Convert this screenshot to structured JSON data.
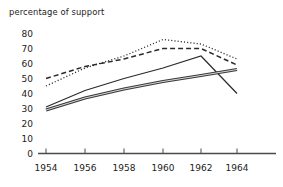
{
  "chart_data": {
    "type": "line",
    "title": "percentage of support",
    "xlabel": "",
    "ylabel": "",
    "x": [
      1954,
      1956,
      1958,
      1960,
      1962,
      1964
    ],
    "xlim": [
      1954,
      1965
    ],
    "ylim": [
      0,
      80
    ],
    "xtick_labels": [
      "1954",
      "1956",
      "1958",
      "1960",
      "1962",
      "1964"
    ],
    "ytick_labels": [
      "0",
      "10",
      "20",
      "30",
      "40",
      "50",
      "60",
      "70",
      "80"
    ],
    "ytick_values": [
      0,
      10,
      20,
      30,
      40,
      50,
      60,
      70,
      80
    ],
    "grid": false,
    "legend": "none",
    "series": [
      {
        "name": "series-dotted",
        "style": "dotted",
        "color": "#2b2b2b",
        "values": [
          45,
          57,
          65,
          76,
          73,
          63
        ]
      },
      {
        "name": "series-dashed",
        "style": "dashed",
        "color": "#2b2b2b",
        "values": [
          50,
          58,
          63,
          70,
          70,
          59
        ]
      },
      {
        "name": "series-solid-peaked",
        "style": "solid",
        "color": "#2b2b2b",
        "values": [
          31,
          42,
          50,
          57,
          65,
          40
        ]
      },
      {
        "name": "series-solid-thick",
        "style": "solid-thick",
        "color": "#3a3a3a",
        "values": [
          29,
          37,
          43,
          48,
          52,
          56
        ]
      }
    ]
  },
  "axes": {
    "y_label_top": "80",
    "x_axis_name": "year-axis",
    "y_axis_name": "percentage-axis"
  }
}
